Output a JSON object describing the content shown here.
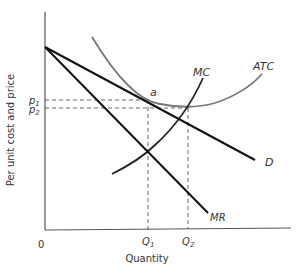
{
  "diagram": {
    "type": "monopoly-cost-revenue-diagram",
    "axes": {
      "y_label": "Per unit cost and price",
      "x_label": "Quantity",
      "origin_label": "0"
    },
    "curves": {
      "demand": {
        "label": "D"
      },
      "marginal_revenue": {
        "label": "MR"
      },
      "marginal_cost": {
        "label": "MC"
      },
      "average_total_cost": {
        "label": "ATC"
      }
    },
    "points": {
      "a": {
        "label": "a"
      }
    },
    "price_labels": {
      "p1": {
        "base": "p",
        "sub": "1"
      },
      "p2": {
        "base": "p",
        "sub": "2"
      }
    },
    "quantity_labels": {
      "q1": {
        "base": "Q",
        "sub": "1"
      },
      "q2": {
        "base": "Q",
        "sub": "2"
      }
    },
    "colors": {
      "axis": "#555555",
      "demand_mr": "#111111",
      "mc": "#222222",
      "atc": "#777777",
      "dashed": "#555555",
      "text": "#333333"
    }
  }
}
